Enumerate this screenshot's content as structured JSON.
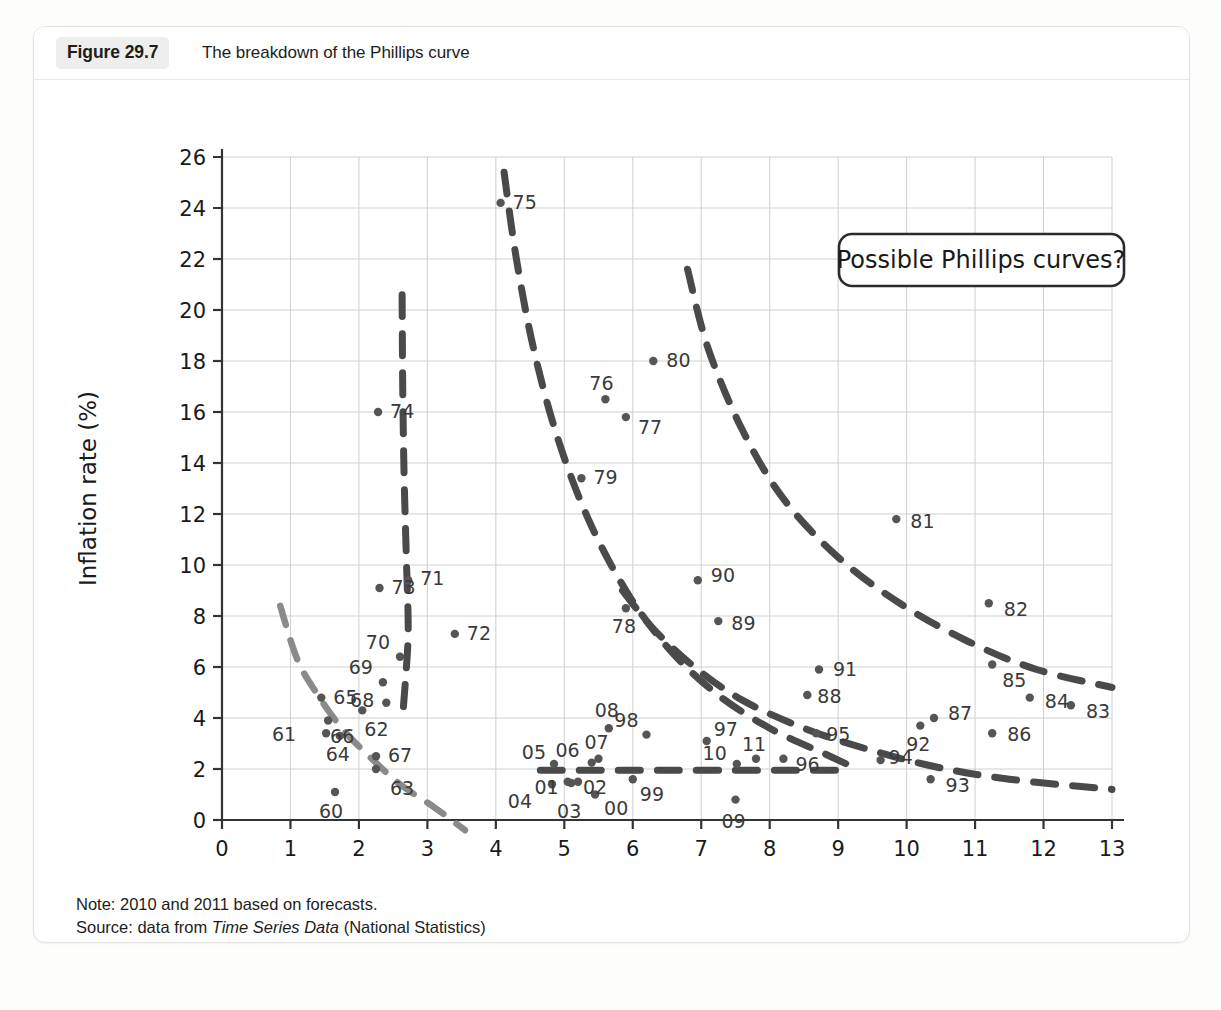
{
  "figure": {
    "number_label": "Figure 29.7",
    "title": "The breakdown of the Phillips curve"
  },
  "notes": {
    "note_prefix": "Note: 2010 and 2011 based on forecasts.",
    "source_prefix": "Source: data from ",
    "source_italic": "Time Series Data",
    "source_suffix": " (National Statistics)"
  },
  "legend": {
    "annotation": "Possible Phillips curves?"
  },
  "colors": {
    "point": "#555555",
    "curve_dark": "#4a4a4a",
    "curve_light": "#8a8a8a",
    "grid": "#cfcfcf",
    "axis": "#333333",
    "card_border": "#e3e3e1",
    "badge_bg": "#eeeeec"
  },
  "chart_data": {
    "type": "scatter",
    "title": "The breakdown of the Phillips curve",
    "xlabel": "Unemployment rate (%)",
    "ylabel": "Inflation rate (%)",
    "xlim": [
      0,
      13
    ],
    "ylim": [
      0,
      26
    ],
    "xticks": [
      "0",
      "1",
      "2",
      "3",
      "4",
      "5",
      "6",
      "7",
      "8",
      "9",
      "10",
      "11",
      "12",
      "13"
    ],
    "yticks": [
      "0",
      "2",
      "4",
      "6",
      "8",
      "10",
      "12",
      "14",
      "16",
      "18",
      "20",
      "22",
      "24",
      "26"
    ],
    "grid": true,
    "legend_position": "top-right",
    "annotations": [
      "Possible Phillips curves?"
    ],
    "point_label_note": "Labels are two-digit years (1960-2011)",
    "points": [
      {
        "label": "60",
        "x": 1.65,
        "y": 1.1
      },
      {
        "label": "61",
        "x": 1.52,
        "y": 3.4
      },
      {
        "label": "62",
        "x": 2.05,
        "y": 4.3
      },
      {
        "label": "63",
        "x": 2.25,
        "y": 2.0
      },
      {
        "label": "64",
        "x": 1.72,
        "y": 3.3
      },
      {
        "label": "65",
        "x": 1.45,
        "y": 4.8
      },
      {
        "label": "66",
        "x": 1.55,
        "y": 3.9
      },
      {
        "label": "67",
        "x": 2.25,
        "y": 2.5
      },
      {
        "label": "68",
        "x": 2.4,
        "y": 4.6
      },
      {
        "label": "69",
        "x": 2.35,
        "y": 5.4
      },
      {
        "label": "70",
        "x": 2.6,
        "y": 6.4
      },
      {
        "label": "71",
        "x": 2.72,
        "y": 9.4
      },
      {
        "label": "72",
        "x": 3.4,
        "y": 7.3
      },
      {
        "label": "73",
        "x": 2.3,
        "y": 9.1
      },
      {
        "label": "74",
        "x": 2.28,
        "y": 16.0
      },
      {
        "label": "75",
        "x": 4.07,
        "y": 24.2
      },
      {
        "label": "76",
        "x": 5.6,
        "y": 16.5
      },
      {
        "label": "77",
        "x": 5.9,
        "y": 15.8
      },
      {
        "label": "78",
        "x": 5.9,
        "y": 8.3
      },
      {
        "label": "79",
        "x": 5.25,
        "y": 13.4
      },
      {
        "label": "80",
        "x": 6.3,
        "y": 18.0
      },
      {
        "label": "81",
        "x": 9.85,
        "y": 11.8
      },
      {
        "label": "82",
        "x": 11.2,
        "y": 8.5
      },
      {
        "label": "83",
        "x": 12.4,
        "y": 4.5
      },
      {
        "label": "84",
        "x": 11.8,
        "y": 4.8
      },
      {
        "label": "85",
        "x": 11.25,
        "y": 6.1
      },
      {
        "label": "86",
        "x": 11.25,
        "y": 3.4
      },
      {
        "label": "87",
        "x": 10.4,
        "y": 4.0
      },
      {
        "label": "88",
        "x": 8.55,
        "y": 4.9
      },
      {
        "label": "89",
        "x": 7.25,
        "y": 7.8
      },
      {
        "label": "90",
        "x": 6.95,
        "y": 9.4
      },
      {
        "label": "91",
        "x": 8.72,
        "y": 5.9
      },
      {
        "label": "92",
        "x": 10.2,
        "y": 3.7
      },
      {
        "label": "93",
        "x": 10.35,
        "y": 1.6
      },
      {
        "label": "94",
        "x": 9.62,
        "y": 2.35
      },
      {
        "label": "95",
        "x": 8.68,
        "y": 3.4
      },
      {
        "label": "96",
        "x": 8.2,
        "y": 2.4
      },
      {
        "label": "97",
        "x": 7.08,
        "y": 3.1
      },
      {
        "label": "98",
        "x": 6.2,
        "y": 3.35
      },
      {
        "label": "99",
        "x": 6.0,
        "y": 1.6
      },
      {
        "label": "00",
        "x": 5.45,
        "y": 1.0
      },
      {
        "label": "01",
        "x": 5.05,
        "y": 1.5
      },
      {
        "label": "02",
        "x": 5.2,
        "y": 1.5
      },
      {
        "label": "03",
        "x": 5.1,
        "y": 1.45
      },
      {
        "label": "04",
        "x": 4.82,
        "y": 1.4
      },
      {
        "label": "05",
        "x": 4.85,
        "y": 2.2
      },
      {
        "label": "06",
        "x": 5.4,
        "y": 2.25
      },
      {
        "label": "07",
        "x": 5.5,
        "y": 2.4
      },
      {
        "label": "08",
        "x": 5.65,
        "y": 3.6
      },
      {
        "label": "09",
        "x": 7.5,
        "y": 0.8
      },
      {
        "label": "10",
        "x": 7.52,
        "y": 2.2
      },
      {
        "label": "11",
        "x": 7.8,
        "y": 2.4
      }
    ],
    "curves": [
      {
        "name": "curve-1960s",
        "style": "dashed-light",
        "points": [
          [
            0.85,
            8.4
          ],
          [
            1.1,
            6.3
          ],
          [
            1.4,
            4.9
          ],
          [
            1.75,
            3.6
          ],
          [
            2.15,
            2.5
          ],
          [
            2.6,
            1.4
          ],
          [
            3.1,
            0.5
          ],
          [
            3.55,
            -0.4
          ]
        ]
      },
      {
        "name": "curve-1970s-vertical",
        "style": "dashed-dark",
        "points": [
          [
            2.63,
            20.6
          ],
          [
            2.64,
            17.0
          ],
          [
            2.66,
            13.5
          ],
          [
            2.69,
            10.5
          ],
          [
            2.72,
            7.5
          ],
          [
            2.68,
            5.5
          ],
          [
            2.63,
            3.8
          ]
        ]
      },
      {
        "name": "curve-1975-1979",
        "style": "dashed-dark",
        "points": [
          [
            4.12,
            25.4
          ],
          [
            4.3,
            22.0
          ],
          [
            4.55,
            18.5
          ],
          [
            4.9,
            15.0
          ],
          [
            5.35,
            11.8
          ],
          [
            5.9,
            9.0
          ],
          [
            6.5,
            6.8
          ],
          [
            7.2,
            5.0
          ],
          [
            8.0,
            3.6
          ],
          [
            8.8,
            2.6
          ],
          [
            9.2,
            2.1
          ]
        ]
      },
      {
        "name": "curve-1980s",
        "style": "dashed-dark",
        "points": [
          [
            6.8,
            21.6
          ],
          [
            7.1,
            18.5
          ],
          [
            7.6,
            15.3
          ],
          [
            8.2,
            12.6
          ],
          [
            9.0,
            10.3
          ],
          [
            9.9,
            8.5
          ],
          [
            10.9,
            7.0
          ],
          [
            11.9,
            5.9
          ],
          [
            13.0,
            5.2
          ]
        ]
      },
      {
        "name": "curve-1990s",
        "style": "dashed-dark",
        "points": [
          [
            5.85,
            9.0
          ],
          [
            6.3,
            7.5
          ],
          [
            6.9,
            6.0
          ],
          [
            7.6,
            4.7
          ],
          [
            8.5,
            3.6
          ],
          [
            9.4,
            2.8
          ],
          [
            10.4,
            2.1
          ],
          [
            11.5,
            1.6
          ],
          [
            13.0,
            1.2
          ]
        ]
      },
      {
        "name": "curve-2000s-flat",
        "style": "dashed-dark",
        "points": [
          [
            4.65,
            1.95
          ],
          [
            5.5,
            1.95
          ],
          [
            6.5,
            1.95
          ],
          [
            7.5,
            1.95
          ],
          [
            8.4,
            1.95
          ],
          [
            9.1,
            1.95
          ]
        ]
      }
    ]
  }
}
